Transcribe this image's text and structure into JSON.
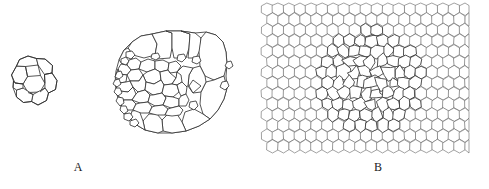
{
  "figure": {
    "background_color": "#ffffff",
    "ink_color": "#2b2b2b",
    "lattice_ink_color": "#555555",
    "width": 489,
    "height": 189
  },
  "panels": [
    {
      "id": "A",
      "label": "A",
      "label_x": 78,
      "label_y": 168,
      "description": "Two epithelial cell clusters shown as polygonal tilings: a small young cluster at left and a larger mature cluster at centre."
    },
    {
      "id": "B",
      "label": "B",
      "label_x": 378,
      "label_y": 168,
      "description": "Regular hexagonal lattice sheet containing a central disordered patch of irregular polygons."
    }
  ],
  "chart_data": {
    "type": "diagram",
    "title": "",
    "subtitle": "",
    "xlabel": "",
    "ylabel": "",
    "legend": [],
    "annotations": [
      "A",
      "B"
    ],
    "clusters": [
      {
        "name": "small-cluster",
        "panel": "A",
        "center_x": 34,
        "center_y": 84,
        "radius": 24,
        "cell_count": 8,
        "core_cells": 1,
        "ring_cells": 7,
        "cell_size": "large-relative-to-cluster"
      },
      {
        "name": "large-cluster",
        "panel": "A",
        "center_x": 170,
        "center_y": 85,
        "radius_x": 57,
        "radius_y": 52,
        "cell_count": 72,
        "core_cells": 52,
        "peripheral_large_cells": 12,
        "cell_size": "small-core-large-periphery"
      },
      {
        "name": "hex-lattice",
        "panel": "B",
        "left": 262,
        "top": 4,
        "right": 468,
        "bottom": 152,
        "columns": 20,
        "rows": 14,
        "pitch": 11,
        "cell_count": 280,
        "ordered_cells": 196,
        "disordered_cells": 84,
        "disorder_center_x": 370,
        "disorder_center_y": 80,
        "disorder_radius": 52
      }
    ]
  }
}
